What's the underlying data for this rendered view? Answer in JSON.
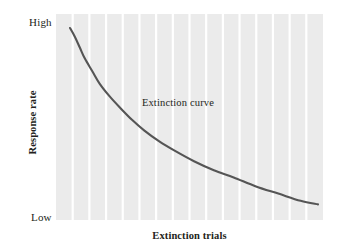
{
  "chart_data": {
    "type": "line",
    "title": "",
    "subtitle": "",
    "xlabel": "Extinction trials",
    "ylabel": "Response rate",
    "grid": "vertical-only",
    "legend": "none",
    "annotations": [
      {
        "text": "Extinction curve",
        "x_frac": 0.29,
        "y_frac": 0.58
      }
    ],
    "axes": {
      "x": {
        "tick_labels": [],
        "range_label_min": "",
        "range_label_max": "",
        "gridline_count": 15
      },
      "y": {
        "tick_labels": [
          "High",
          "Low"
        ],
        "range_label_min": "Low",
        "range_label_max": "High"
      }
    },
    "series": [
      {
        "name": "Extinction curve",
        "color": "#555555",
        "x": [
          0.0,
          0.02,
          0.04,
          0.06,
          0.09,
          0.12,
          0.16,
          0.2,
          0.25,
          0.3,
          0.36,
          0.42,
          0.5,
          0.58,
          0.66,
          0.75,
          0.84,
          0.93,
          1.0
        ],
        "y": [
          1.0,
          0.95,
          0.89,
          0.83,
          0.76,
          0.69,
          0.62,
          0.56,
          0.49,
          0.43,
          0.37,
          0.32,
          0.26,
          0.21,
          0.17,
          0.12,
          0.08,
          0.04,
          0.02
        ]
      }
    ],
    "colors": {
      "plot_background": "#ebebeb",
      "gridline": "#ffffff",
      "curve": "#555555",
      "text": "#231f20",
      "page_background": "#ffffff"
    }
  }
}
